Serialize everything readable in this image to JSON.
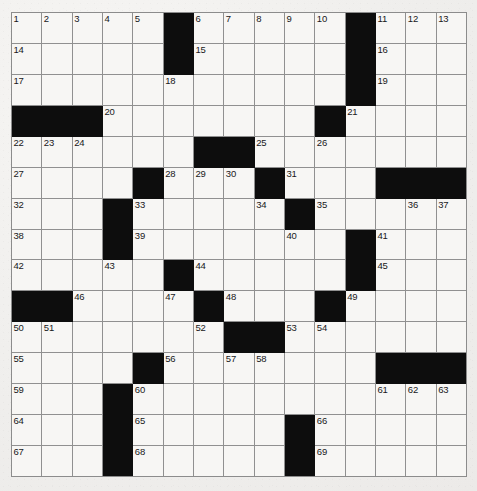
{
  "puzzle": {
    "title": "Crossword Puzzle Grid",
    "rows": 15,
    "cols": 15,
    "cell_color": "#f7f6f4",
    "block_color": "#0d0d0d",
    "grid_line_color": "#909090",
    "page_background": "#efeeec",
    "number_count": 69,
    "grid": [
      [
        "1",
        "2",
        "3",
        "4",
        "5",
        "#",
        "6",
        "7",
        "8",
        "9",
        "10",
        "#",
        "11",
        "12",
        "13"
      ],
      [
        "14",
        "",
        "",
        "",
        "",
        "#",
        "15",
        "",
        "",
        "",
        "",
        "#",
        "16",
        "",
        ""
      ],
      [
        "17",
        "",
        "",
        "",
        "",
        "18",
        "",
        "",
        "",
        "",
        "",
        "#",
        "19",
        "",
        ""
      ],
      [
        "#",
        "#",
        "#",
        "20",
        "",
        "",
        "",
        "",
        "",
        "",
        "#",
        "21",
        "",
        "",
        ""
      ],
      [
        "22",
        "23",
        "24",
        "",
        "",
        "",
        "#",
        "#",
        "25",
        "",
        "26",
        "",
        "",
        "",
        ""
      ],
      [
        "27",
        "",
        "",
        "",
        "#",
        "28",
        "29",
        "30",
        "#",
        "31",
        "",
        "",
        "#",
        "#",
        "#"
      ],
      [
        "32",
        "",
        "",
        "#",
        "33",
        "",
        "",
        "",
        "34",
        "#",
        "35",
        "",
        "",
        "36",
        "37"
      ],
      [
        "38",
        "",
        "",
        "#",
        "39",
        "",
        "",
        "",
        "",
        "40",
        "",
        "#",
        "41",
        "",
        ""
      ],
      [
        "42",
        "",
        "",
        "43",
        "",
        "#",
        "44",
        "",
        "",
        "",
        "",
        "#",
        "45",
        "",
        ""
      ],
      [
        "#",
        "#",
        "46",
        "",
        "",
        "47",
        "#",
        "48",
        "",
        "",
        "#",
        "49",
        "",
        "",
        ""
      ],
      [
        "50",
        "51",
        "",
        "",
        "",
        "",
        "52",
        "#",
        "#",
        "53",
        "54",
        "",
        "",
        "",
        ""
      ],
      [
        "55",
        "",
        "",
        "",
        "#",
        "56",
        "",
        "57",
        "58",
        "",
        "",
        "",
        "#",
        "#",
        "#"
      ],
      [
        "59",
        "",
        "",
        "#",
        "60",
        "",
        "",
        "",
        "",
        "",
        "",
        "",
        "61",
        "62",
        "63"
      ],
      [
        "64",
        "",
        "",
        "#",
        "65",
        "",
        "",
        "",
        "",
        "#",
        "66",
        "",
        "",
        "",
        ""
      ],
      [
        "67",
        "",
        "",
        "#",
        "68",
        "",
        "",
        "",
        "",
        "#",
        "69",
        "",
        "",
        "",
        ""
      ]
    ],
    "across_numbers": [
      1,
      6,
      11,
      14,
      15,
      16,
      17,
      18,
      19,
      20,
      21,
      22,
      25,
      27,
      28,
      31,
      32,
      33,
      35,
      38,
      39,
      41,
      42,
      44,
      45,
      46,
      48,
      49,
      50,
      53,
      55,
      56,
      59,
      61,
      64,
      65,
      66,
      67,
      68,
      69
    ],
    "down_numbers": [
      1,
      2,
      3,
      4,
      5,
      6,
      7,
      8,
      9,
      10,
      11,
      12,
      13,
      18,
      20,
      21,
      23,
      24,
      26,
      28,
      29,
      30,
      34,
      36,
      37,
      40,
      43,
      44,
      47,
      51,
      52,
      54,
      57,
      58,
      60,
      62,
      63
    ]
  }
}
